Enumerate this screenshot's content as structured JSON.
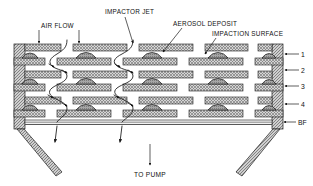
{
  "figure": {
    "title_labels": {
      "air_flow": "AIR FLOW",
      "impactor_jet": "IMPACTOR JET",
      "aerosol_deposit": "AEROSOL DEPOSIT",
      "impaction_surface": "IMPACTION SURFACE"
    },
    "stage_labels": [
      {
        "text": "1"
      },
      {
        "text": "2"
      },
      {
        "text": "3"
      },
      {
        "text": "4"
      },
      {
        "text": "BF"
      }
    ],
    "outlet_label": "TO PUMP",
    "colors": {
      "ink": "#1a1a1a",
      "hatch": "#8c8c8c",
      "plate_fill": "#c9c9c9",
      "deposit_fill": "#9a9a9a",
      "wall_fill": "#b4b4b4",
      "background": "#ffffff"
    },
    "geometry": {
      "plate_rows": 9,
      "stages": 5,
      "jet_count_per_row": 5
    }
  }
}
